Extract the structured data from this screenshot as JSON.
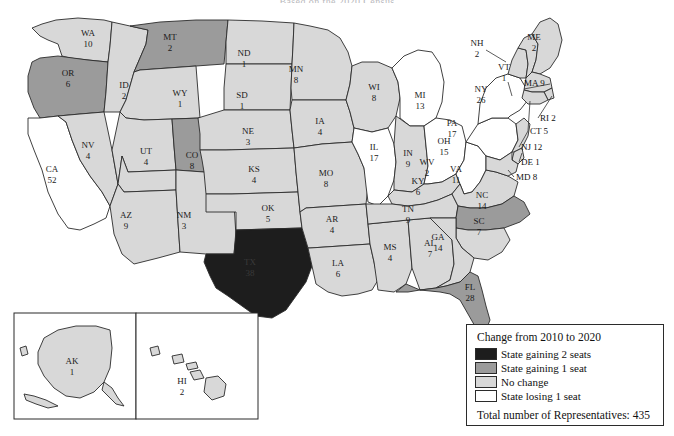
{
  "title": "Based on the 2020 Census",
  "legend": {
    "title": "Change from 2010 to 2020",
    "items": [
      {
        "label": "State gaining 2 seats",
        "swatch": "black",
        "color": "#1d1d1d"
      },
      {
        "label": "State gaining 1 seat",
        "swatch": "dark",
        "color": "#9b9b9b"
      },
      {
        "label": "No change",
        "swatch": "light",
        "color": "#d8d8d8"
      },
      {
        "label": "State losing 1 seat",
        "swatch": "white",
        "color": "#ffffff"
      }
    ],
    "total": "Total number of Representatives: 435"
  },
  "states": {
    "WA": {
      "abbr": "WA",
      "seats": "10",
      "category": "light"
    },
    "OR": {
      "abbr": "OR",
      "seats": "6",
      "category": "dark"
    },
    "CA": {
      "abbr": "CA",
      "seats": "52",
      "category": "white"
    },
    "NV": {
      "abbr": "NV",
      "seats": "4",
      "category": "light"
    },
    "ID": {
      "abbr": "ID",
      "seats": "2",
      "category": "light"
    },
    "MT": {
      "abbr": "MT",
      "seats": "2",
      "category": "dark"
    },
    "WY": {
      "abbr": "WY",
      "seats": "1",
      "category": "light"
    },
    "UT": {
      "abbr": "UT",
      "seats": "4",
      "category": "light"
    },
    "AZ": {
      "abbr": "AZ",
      "seats": "9",
      "category": "light"
    },
    "CO": {
      "abbr": "CO",
      "seats": "8",
      "category": "dark"
    },
    "NM": {
      "abbr": "NM",
      "seats": "3",
      "category": "light"
    },
    "ND": {
      "abbr": "ND",
      "seats": "1",
      "category": "light"
    },
    "SD": {
      "abbr": "SD",
      "seats": "1",
      "category": "light"
    },
    "NE": {
      "abbr": "NE",
      "seats": "3",
      "category": "light"
    },
    "KS": {
      "abbr": "KS",
      "seats": "4",
      "category": "light"
    },
    "OK": {
      "abbr": "OK",
      "seats": "5",
      "category": "light"
    },
    "TX": {
      "abbr": "TX",
      "seats": "38",
      "category": "black"
    },
    "MN": {
      "abbr": "MN",
      "seats": "8",
      "category": "light"
    },
    "IA": {
      "abbr": "IA",
      "seats": "4",
      "category": "light"
    },
    "MO": {
      "abbr": "MO",
      "seats": "8",
      "category": "light"
    },
    "AR": {
      "abbr": "AR",
      "seats": "4",
      "category": "light"
    },
    "LA": {
      "abbr": "LA",
      "seats": "6",
      "category": "light"
    },
    "WI": {
      "abbr": "WI",
      "seats": "8",
      "category": "light"
    },
    "IL": {
      "abbr": "IL",
      "seats": "17",
      "category": "white"
    },
    "MS": {
      "abbr": "MS",
      "seats": "4",
      "category": "light"
    },
    "AL": {
      "abbr": "AL",
      "seats": "7",
      "category": "light"
    },
    "MI": {
      "abbr": "MI",
      "seats": "13",
      "category": "white"
    },
    "IN": {
      "abbr": "IN",
      "seats": "9",
      "category": "light"
    },
    "OH": {
      "abbr": "OH",
      "seats": "15",
      "category": "white"
    },
    "KY": {
      "abbr": "KY",
      "seats": "6",
      "category": "light"
    },
    "TN": {
      "abbr": "TN",
      "seats": "9",
      "category": "light"
    },
    "GA": {
      "abbr": "GA",
      "seats": "14",
      "category": "light"
    },
    "FL": {
      "abbr": "FL",
      "seats": "28",
      "category": "dark"
    },
    "SC": {
      "abbr": "SC",
      "seats": "7",
      "category": "light"
    },
    "NC": {
      "abbr": "NC",
      "seats": "14",
      "category": "dark"
    },
    "VA": {
      "abbr": "VA",
      "seats": "11",
      "category": "light"
    },
    "WV": {
      "abbr": "WV",
      "seats": "2",
      "category": "white"
    },
    "PA": {
      "abbr": "PA",
      "seats": "17",
      "category": "white"
    },
    "NY": {
      "abbr": "NY",
      "seats": "26",
      "category": "white"
    },
    "VT": {
      "abbr": "VT",
      "seats": "1",
      "category": "light"
    },
    "NH": {
      "abbr": "NH",
      "seats": "2",
      "category": "light"
    },
    "ME": {
      "abbr": "ME",
      "seats": "2",
      "category": "light"
    },
    "MA": {
      "abbr": "MA",
      "seats": "9",
      "category": "light"
    },
    "RI": {
      "abbr": "RI",
      "seats": "2",
      "category": "light"
    },
    "CT": {
      "abbr": "CT",
      "seats": "5",
      "category": "light"
    },
    "NJ": {
      "abbr": "NJ",
      "seats": "12",
      "category": "light"
    },
    "DE": {
      "abbr": "DE",
      "seats": "1",
      "category": "light"
    },
    "MD": {
      "abbr": "MD",
      "seats": "8",
      "category": "light"
    },
    "AK": {
      "abbr": "AK",
      "seats": "1",
      "category": "light"
    },
    "HI": {
      "abbr": "HI",
      "seats": "2",
      "category": "light"
    }
  },
  "callouts": [
    {
      "key": "MA",
      "text": "MA 9"
    },
    {
      "key": "RI",
      "text": "RI 2"
    },
    {
      "key": "CT",
      "text": "CT 5"
    },
    {
      "key": "NJ",
      "text": "NJ 12"
    },
    {
      "key": "DE",
      "text": "DE 1"
    },
    {
      "key": "MD",
      "text": "MD 8"
    }
  ]
}
